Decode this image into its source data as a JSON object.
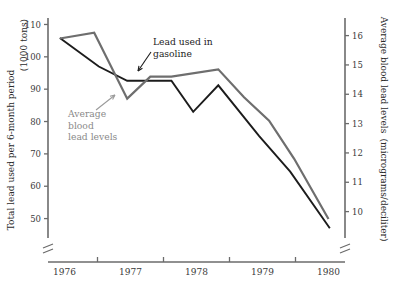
{
  "chart_data": {
    "type": "line",
    "title": "",
    "xlabel": "",
    "x_tick_labels": [
      "1976",
      "1977",
      "1978",
      "1979",
      "1980"
    ],
    "x_axis": {
      "start_year": 1975.75,
      "end_year": 1980.25,
      "tick_years": [
        1976.5,
        1977.5,
        1978.5,
        1979.5
      ],
      "label_years": [
        1976.0,
        1977.0,
        1978.0,
        1979.0,
        1980.0
      ],
      "broken_axis": true
    },
    "left_axis": {
      "label_line1": "Total lead used per 6-month period",
      "label_line2": "(1000 tons)",
      "ticks": [
        50,
        60,
        70,
        80,
        90,
        100,
        110
      ],
      "ylim": [
        44,
        112
      ],
      "units": "1000 tons",
      "broken_axis": true
    },
    "right_axis": {
      "label_line1": "Average blood lead levels",
      "label_line2": "(micrograms/deciliter)",
      "ticks": [
        10,
        11,
        12,
        13,
        14,
        15,
        16
      ],
      "ylim": [
        9.1,
        16.6
      ],
      "units": "micrograms/deciliter",
      "broken_axis": true
    },
    "series": [
      {
        "name": "Lead used in gasoline",
        "axis": "left",
        "color": "#1c1c1c",
        "stroke_width": 1.9,
        "points": [
          {
            "x": 1975.93,
            "y": 105.8
          },
          {
            "x": 1976.52,
            "y": 97.0
          },
          {
            "x": 1976.95,
            "y": 92.6
          },
          {
            "x": 1977.62,
            "y": 92.6
          },
          {
            "x": 1977.95,
            "y": 83.0
          },
          {
            "x": 1978.33,
            "y": 91.2
          },
          {
            "x": 1978.95,
            "y": 75.5
          },
          {
            "x": 1979.42,
            "y": 64.5
          },
          {
            "x": 1980.02,
            "y": 47.0
          }
        ]
      },
      {
        "name": "Average blood lead levels",
        "axis": "right",
        "color": "#6e6e6e",
        "stroke_width": 2.2,
        "points": [
          {
            "x": 1975.93,
            "y": 15.9
          },
          {
            "x": 1976.45,
            "y": 16.1
          },
          {
            "x": 1976.95,
            "y": 13.85
          },
          {
            "x": 1977.3,
            "y": 14.6
          },
          {
            "x": 1977.62,
            "y": 14.6
          },
          {
            "x": 1978.33,
            "y": 14.85
          },
          {
            "x": 1978.72,
            "y": 13.9
          },
          {
            "x": 1979.1,
            "y": 13.1
          },
          {
            "x": 1979.48,
            "y": 11.8
          },
          {
            "x": 1980.0,
            "y": 9.75
          }
        ]
      }
    ],
    "annotations": [
      {
        "id": "lead-used-in-gasoline",
        "text_lines": [
          "Lead used in",
          "gasoline"
        ],
        "color": "#1c1c1c",
        "text_x": 153,
        "text_y": 45,
        "arrow_from_x": 151,
        "arrow_from_y": 52,
        "arrow_to_x": 138,
        "arrow_to_y": 71
      },
      {
        "id": "average-blood-lead-levels",
        "text_lines": [
          "Average",
          "blood",
          "lead levels"
        ],
        "color": "#9a9a9a",
        "text_x": 68,
        "text_y": 117,
        "arrow_from_x": 96,
        "arrow_from_y": 110,
        "arrow_to_x": 115,
        "arrow_to_y": 95
      }
    ]
  }
}
